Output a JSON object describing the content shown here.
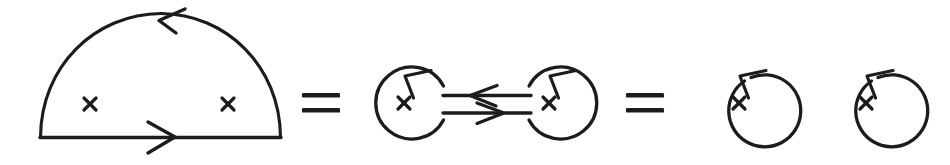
{
  "figure": {
    "background_color": "#ffffff",
    "ink_color": "#1c1c1c",
    "terms": [
      {
        "id": "term-1",
        "kind": "semicircle-loop",
        "label": "semicircular propagator loop with two cross vertices",
        "crosses": 2,
        "cross_glyph": "x",
        "arrows": [
          {
            "name": "arc-arrow",
            "direction": "left",
            "position": "top-of-arc"
          },
          {
            "name": "baseline-arrow",
            "direction": "right",
            "position": "middle-of-baseline"
          }
        ]
      },
      {
        "id": "operator-1",
        "kind": "equals",
        "label": "="
      },
      {
        "id": "term-2",
        "kind": "two-joined-circles",
        "label": "two circles with crosses joined by a double propagator line",
        "crosses": 2,
        "cross_glyph": "x",
        "circles": [
          {
            "name": "left-circle",
            "cross_glyph": "x",
            "loop_arrow_direction": "counterclockwise"
          },
          {
            "name": "right-circle",
            "cross_glyph": "x",
            "loop_arrow_direction": "counterclockwise"
          }
        ],
        "connector_arrows": [
          {
            "name": "upper-connector-arrow",
            "direction": "left"
          },
          {
            "name": "lower-connector-arrow",
            "direction": "right"
          }
        ]
      },
      {
        "id": "operator-2",
        "kind": "equals",
        "label": "="
      },
      {
        "id": "term-3",
        "kind": "two-separate-circles",
        "label": "two disconnected circles each with a cross",
        "crosses": 2,
        "cross_glyph": "x",
        "circles": [
          {
            "name": "left-circle",
            "cross_glyph": "x",
            "loop_arrow_direction": "counterclockwise"
          },
          {
            "name": "right-circle",
            "cross_glyph": "x",
            "loop_arrow_direction": "counterclockwise"
          }
        ]
      }
    ]
  }
}
